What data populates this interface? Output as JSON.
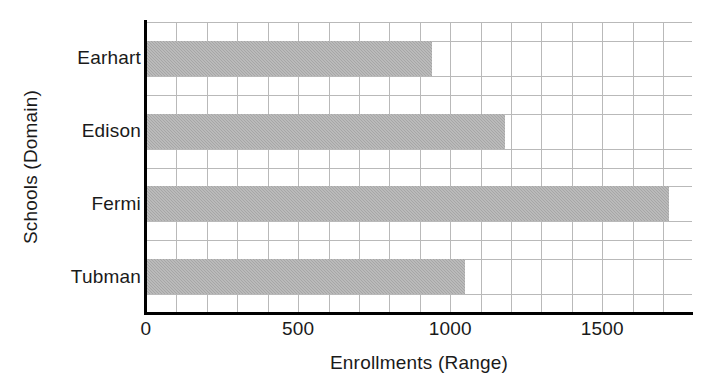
{
  "chart_data": {
    "type": "bar",
    "orientation": "horizontal",
    "title": "",
    "xlabel": "Enrollments (Range)",
    "ylabel": "Schools (Domain)",
    "categories": [
      "Earhart",
      "Edison",
      "Fermi",
      "Tubman"
    ],
    "values": [
      940,
      1180,
      1720,
      1050
    ],
    "series": [
      {
        "name": "Enrollments",
        "values": [
          940,
          1180,
          1720,
          1050
        ]
      }
    ],
    "xlim": [
      0,
      1795
    ],
    "xticks": [
      0,
      500,
      1000,
      1500
    ],
    "xtick_labels": [
      "0",
      "500",
      "1000",
      "1500"
    ],
    "grid": true,
    "grid_minor_step": 100,
    "legend": "none",
    "bar_color": "#a6a6a6",
    "grid_color": "#b9b9b9",
    "axis_color": "#000000",
    "background": "#ffffff"
  }
}
